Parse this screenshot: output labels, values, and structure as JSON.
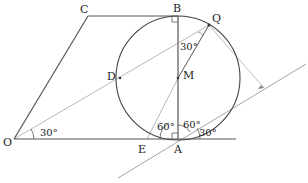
{
  "diagram": {
    "type": "geometry",
    "points": {
      "O": {
        "label": "O",
        "x": 14,
        "y": 139
      },
      "A": {
        "label": "A",
        "x": 178,
        "y": 139
      },
      "B": {
        "label": "B",
        "x": 178,
        "y": 16
      },
      "C": {
        "label": "C",
        "x": 88,
        "y": 16
      },
      "D": {
        "label": "D",
        "x": 120,
        "y": 78
      },
      "M": {
        "label": "M",
        "x": 178,
        "y": 78
      },
      "Q": {
        "label": "Q",
        "x": 209,
        "y": 25
      },
      "E": {
        "label": "E",
        "x": 147,
        "y": 139
      }
    },
    "circle": {
      "center": "M",
      "radius": 62
    },
    "angles": {
      "at_O": "30°",
      "at_Q": "30°",
      "at_A_left": "60°",
      "at_A_right": "60°",
      "at_A_tangent": "30°"
    },
    "right_angles": [
      "B",
      "A"
    ],
    "colors": {
      "main_line": "#444444",
      "light_line": "#aaaaaa",
      "label": "#222222"
    }
  }
}
